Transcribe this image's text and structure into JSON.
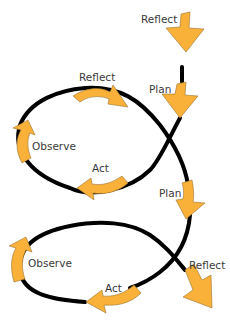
{
  "diagram": {
    "type": "action-research-spiral",
    "colors": {
      "arrow_fill": "#F9B13A",
      "arrow_stroke": "#8A6A2A",
      "path": "#000000",
      "label": "#3a3a3a"
    },
    "cycles": [
      {
        "name": "cycle-1",
        "steps": [
          "Reflect",
          "Plan",
          "Act",
          "Observe",
          "Reflect"
        ]
      },
      {
        "name": "cycle-2",
        "steps": [
          "Plan",
          "Act",
          "Observe",
          "Reflect"
        ]
      }
    ],
    "labels": {
      "top_reflect": "Reflect",
      "plan_1": "Plan",
      "reflect_1": "Reflect",
      "observe_1": "Observe",
      "act_1": "Act",
      "plan_2": "Plan",
      "observe_2": "Observe",
      "act_2": "Act",
      "reflect_2": "Reflect"
    }
  }
}
